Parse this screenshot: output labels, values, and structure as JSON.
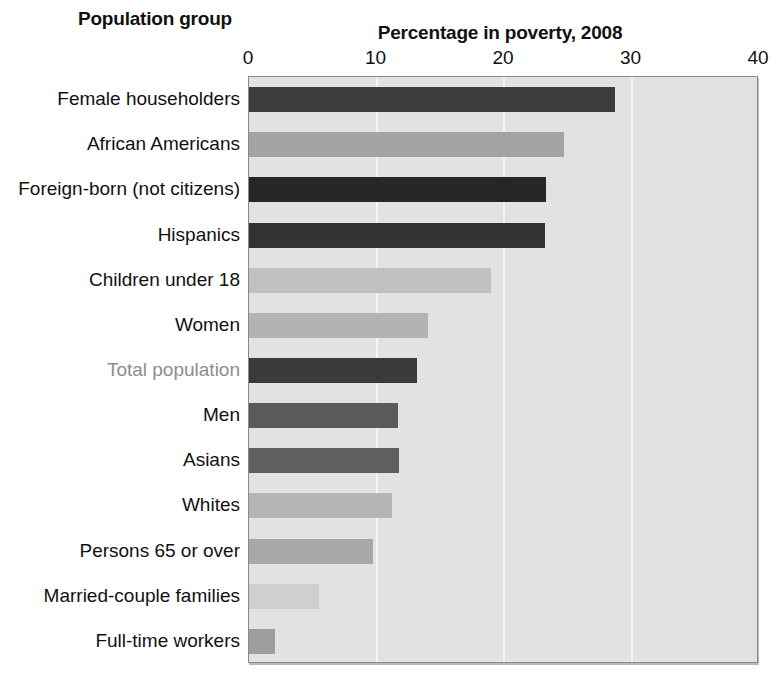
{
  "headings": {
    "category_axis_title": "Population group",
    "value_axis_title": "Percentage in poverty, 2008"
  },
  "colors": {
    "plot_background": "#e2e2e2",
    "gridline": "#f4f4f4",
    "plot_border": "#8a8a8a",
    "text": "#111111",
    "muted_text": "#8d8d8d"
  },
  "chart_data": {
    "type": "bar",
    "orientation": "horizontal",
    "title": "Percentage in poverty, 2008",
    "xlabel": "Percentage in poverty, 2008",
    "ylabel": "Population group",
    "xlim": [
      0,
      40
    ],
    "xticks": [
      0,
      10,
      20,
      30,
      40
    ],
    "xticklabels": [
      "0",
      "10",
      "20",
      "30",
      "40"
    ],
    "grid": true,
    "legend": "none",
    "categories": [
      "Female householders",
      "African Americans",
      "Foreign-born (not citizens)",
      "Hispanics",
      "Children under 18",
      "Women",
      "Total population",
      "Men",
      "Asians",
      "Whites",
      "Persons 65 or over",
      "Married-couple families",
      "Full-time workers"
    ],
    "values": [
      28.7,
      24.7,
      23.3,
      23.2,
      19.0,
      14.0,
      13.2,
      11.7,
      11.8,
      11.2,
      9.7,
      5.5,
      2.0
    ],
    "bar_colors": [
      "#3c3c3c",
      "#a3a3a3",
      "#262626",
      "#333333",
      "#c0c0c0",
      "#b3b3b3",
      "#3a3a3a",
      "#5a5a5a",
      "#5f5f5f",
      "#b5b5b5",
      "#a8a8a8",
      "#cfcfcf",
      "#9d9d9d"
    ],
    "label_colors": [
      "#111111",
      "#111111",
      "#111111",
      "#111111",
      "#111111",
      "#111111",
      "#8d8d8d",
      "#111111",
      "#111111",
      "#111111",
      "#111111",
      "#111111",
      "#111111"
    ]
  }
}
